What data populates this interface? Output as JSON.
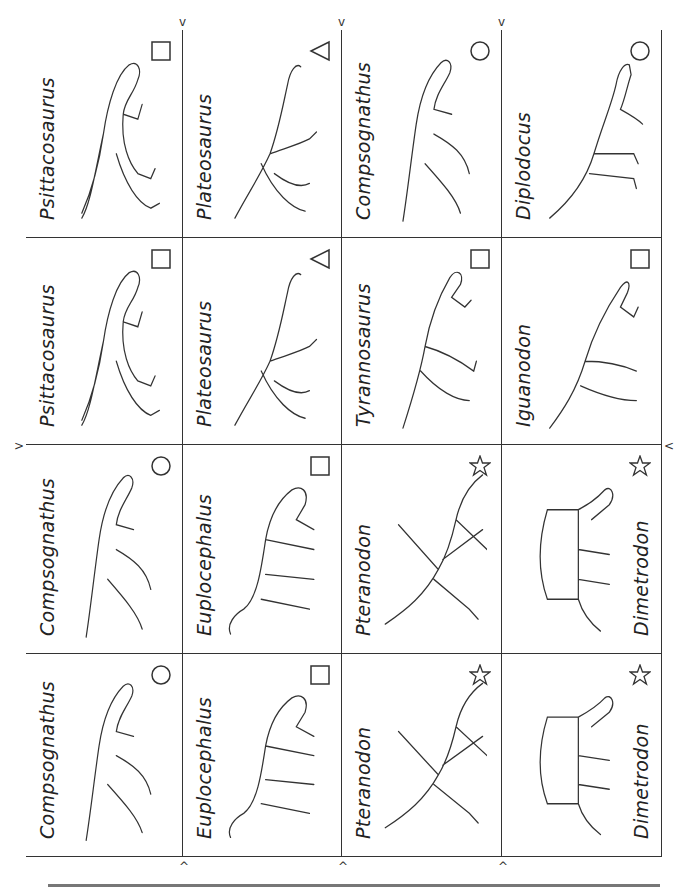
{
  "sheet": {
    "title": "Dinosaur matching cards",
    "columns": [
      26,
      183,
      342,
      502,
      662
    ],
    "rows": [
      30,
      238,
      445,
      654,
      857
    ],
    "cards": [
      [
        {
          "name": "Psittacosaurus",
          "symbol": "square",
          "art": "biped"
        },
        {
          "name": "Plateosaurus",
          "symbol": "triangle",
          "art": "longneck-biped"
        },
        {
          "name": "Compsognathus",
          "symbol": "circle",
          "art": "small-biped"
        },
        {
          "name": "Diplodocus",
          "symbol": "circle",
          "art": "sauropod"
        }
      ],
      [
        {
          "name": "Psittacosaurus",
          "symbol": "square",
          "art": "biped"
        },
        {
          "name": "Plateosaurus",
          "symbol": "triangle",
          "art": "longneck-biped"
        },
        {
          "name": "Tyrannosaurus",
          "symbol": "square",
          "art": "theropod"
        },
        {
          "name": "Iguanodon",
          "symbol": "square",
          "art": "iguanodon"
        }
      ],
      [
        {
          "name": "Compsognathus",
          "symbol": "circle",
          "art": "small-biped"
        },
        {
          "name": "Euplocephalus",
          "symbol": "square",
          "art": "ankylosaur"
        },
        {
          "name": "Pteranodon",
          "symbol": "star",
          "art": "pterosaur"
        },
        {
          "name": "Dimetrodon",
          "symbol": "star",
          "art": "sail"
        }
      ],
      [
        {
          "name": "Compsognathus",
          "symbol": "circle",
          "art": "small-biped"
        },
        {
          "name": "Euplocephalus",
          "symbol": "square",
          "art": "ankylosaur"
        },
        {
          "name": "Pteranodon",
          "symbol": "star",
          "art": "pterosaur"
        },
        {
          "name": "Dimetrodon",
          "symbol": "star",
          "art": "sail"
        }
      ]
    ],
    "cut_markers": {
      "top": [
        "v",
        "v",
        "v"
      ],
      "bottom": [
        "^",
        "^",
        "^"
      ],
      "left": [
        ">"
      ],
      "right": [
        "<"
      ]
    }
  }
}
